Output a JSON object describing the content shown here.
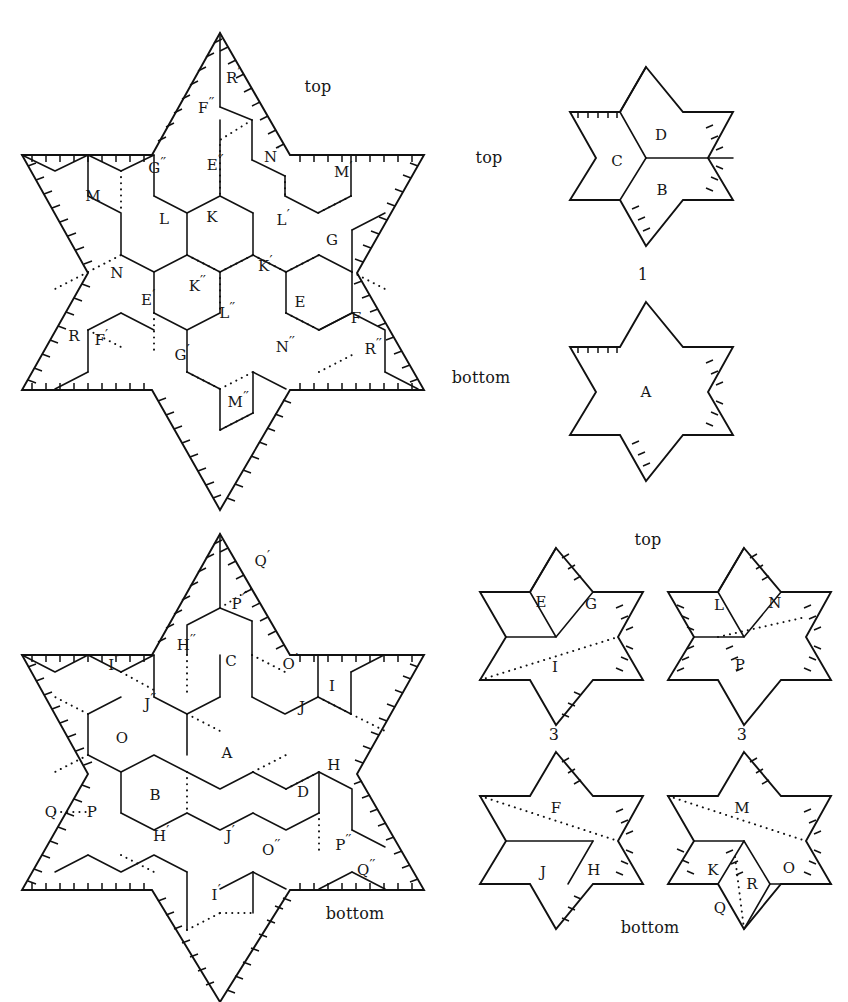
{
  "figure": {
    "title_annotations": [
      {
        "id": "ann-top-left-star",
        "text": "top",
        "x": 318,
        "y": 87
      },
      {
        "id": "ann-top-right-star-top",
        "text": "top",
        "x": 489,
        "y": 158
      },
      {
        "id": "ann-top-right-star-number",
        "text": "1",
        "x": 643,
        "y": 275
      },
      {
        "id": "ann-top-right-star-bottom",
        "text": "bottom",
        "x": 481,
        "y": 378
      },
      {
        "id": "ann-bottom-left-star",
        "text": "bottom",
        "x": 355,
        "y": 914
      },
      {
        "id": "ann-bottom-right-group-top",
        "text": "top",
        "x": 648,
        "y": 540
      },
      {
        "id": "ann-small-star-3-number-left",
        "text": "3",
        "x": 554,
        "y": 735
      },
      {
        "id": "ann-small-star-3-number-right",
        "text": "3",
        "x": 742,
        "y": 735
      },
      {
        "id": "ann-bottom-right-group-bottom",
        "text": "bottom",
        "x": 650,
        "y": 928
      }
    ],
    "panels": [
      {
        "id": "panel-large-top-star",
        "name": "large-hexagram-top",
        "caption": "top",
        "region_labels": [
          {
            "text": "R'",
            "x": 233,
            "y": 76
          },
          {
            "text": "F''",
            "x": 206,
            "y": 106
          },
          {
            "text": "N'",
            "x": 272,
            "y": 155
          },
          {
            "text": "G''",
            "x": 157,
            "y": 166
          },
          {
            "text": "E''",
            "x": 215,
            "y": 163
          },
          {
            "text": "M'",
            "x": 343,
            "y": 170
          },
          {
            "text": "M",
            "x": 93,
            "y": 196
          },
          {
            "text": "L",
            "x": 164,
            "y": 219
          },
          {
            "text": "K",
            "x": 212,
            "y": 217
          },
          {
            "text": "L'",
            "x": 283,
            "y": 218
          },
          {
            "text": "G",
            "x": 332,
            "y": 240
          },
          {
            "text": "N",
            "x": 117,
            "y": 273
          },
          {
            "text": "K'",
            "x": 265,
            "y": 264
          },
          {
            "text": "E'",
            "x": 148,
            "y": 298
          },
          {
            "text": "K''",
            "x": 197,
            "y": 284
          },
          {
            "text": "E",
            "x": 300,
            "y": 302
          },
          {
            "text": "F",
            "x": 356,
            "y": 318
          },
          {
            "text": "R",
            "x": 74,
            "y": 336
          },
          {
            "text": "F'",
            "x": 101,
            "y": 338
          },
          {
            "text": "L''",
            "x": 227,
            "y": 311
          },
          {
            "text": "N''",
            "x": 285,
            "y": 345
          },
          {
            "text": "R''",
            "x": 373,
            "y": 347
          },
          {
            "text": "G'",
            "x": 182,
            "y": 353
          },
          {
            "text": "M''",
            "x": 238,
            "y": 400
          }
        ]
      },
      {
        "id": "panel-small-star-1-top",
        "name": "small-hexagram-1-top",
        "caption": "top",
        "number": "1",
        "region_labels": [
          {
            "text": "D",
            "x": 661,
            "y": 135
          },
          {
            "text": "C",
            "x": 617,
            "y": 161
          },
          {
            "text": "B",
            "x": 662,
            "y": 190
          }
        ]
      },
      {
        "id": "panel-small-star-1-bottom",
        "name": "small-hexagram-1-bottom",
        "caption": "bottom",
        "region_labels": [
          {
            "text": "A",
            "x": 646,
            "y": 392
          }
        ]
      },
      {
        "id": "panel-large-bottom-star",
        "name": "large-hexagram-bottom",
        "caption": "bottom",
        "region_labels": [
          {
            "text": "Q'",
            "x": 262,
            "y": 559
          },
          {
            "text": "P'",
            "x": 238,
            "y": 602
          },
          {
            "text": "H''",
            "x": 186,
            "y": 643
          },
          {
            "text": "I''",
            "x": 114,
            "y": 663
          },
          {
            "text": "C",
            "x": 231,
            "y": 661
          },
          {
            "text": "O'",
            "x": 290,
            "y": 662
          },
          {
            "text": "I",
            "x": 332,
            "y": 686
          },
          {
            "text": "J''",
            "x": 150,
            "y": 702
          },
          {
            "text": "J",
            "x": 302,
            "y": 707
          },
          {
            "text": "O",
            "x": 122,
            "y": 738
          },
          {
            "text": "A",
            "x": 227,
            "y": 753
          },
          {
            "text": "H",
            "x": 334,
            "y": 765
          },
          {
            "text": "B",
            "x": 155,
            "y": 795
          },
          {
            "text": "D",
            "x": 303,
            "y": 792
          },
          {
            "text": "Q",
            "x": 51,
            "y": 812
          },
          {
            "text": "P",
            "x": 92,
            "y": 812
          },
          {
            "text": "H'",
            "x": 161,
            "y": 834
          },
          {
            "text": "J'",
            "x": 230,
            "y": 834
          },
          {
            "text": "O''",
            "x": 271,
            "y": 848
          },
          {
            "text": "P''",
            "x": 343,
            "y": 843
          },
          {
            "text": "Q''",
            "x": 366,
            "y": 868
          },
          {
            "text": "I'",
            "x": 216,
            "y": 893
          }
        ]
      },
      {
        "id": "panel-small-star-3-left-top",
        "name": "small-hexagram-3-left-top",
        "number": "3",
        "region_labels": [
          {
            "text": "E",
            "x": 541,
            "y": 602
          },
          {
            "text": "G",
            "x": 591,
            "y": 604
          },
          {
            "text": "I",
            "x": 555,
            "y": 667
          }
        ]
      },
      {
        "id": "panel-small-star-3-right-top",
        "name": "small-hexagram-3-right-top",
        "number": "3",
        "region_labels": [
          {
            "text": "L",
            "x": 719,
            "y": 605
          },
          {
            "text": "N",
            "x": 775,
            "y": 603
          },
          {
            "text": "P",
            "x": 740,
            "y": 665
          }
        ]
      },
      {
        "id": "panel-small-star-bottom-left",
        "name": "small-hexagram-bottom-left",
        "region_labels": [
          {
            "text": "F",
            "x": 556,
            "y": 808
          },
          {
            "text": "J",
            "x": 543,
            "y": 872
          },
          {
            "text": "H",
            "x": 594,
            "y": 870
          }
        ]
      },
      {
        "id": "panel-small-star-bottom-right",
        "name": "small-hexagram-bottom-right",
        "region_labels": [
          {
            "text": "M",
            "x": 742,
            "y": 808
          },
          {
            "text": "K",
            "x": 713,
            "y": 870
          },
          {
            "text": "R",
            "x": 752,
            "y": 884
          },
          {
            "text": "O",
            "x": 789,
            "y": 868
          },
          {
            "text": "Q",
            "x": 720,
            "y": 908
          }
        ]
      }
    ],
    "colors": {
      "stroke": "#111111",
      "background": "#ffffff",
      "text": "#161616"
    }
  }
}
